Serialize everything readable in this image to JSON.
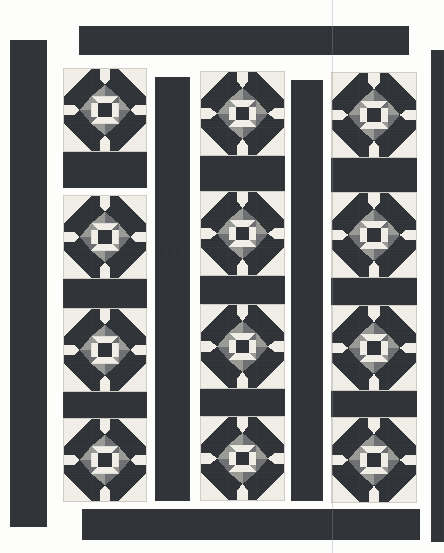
{
  "artwork": {
    "title": "Patchwork Quilt Top Layout",
    "pattern_name": "Dutch Rose / Carpenter's Star Blocks with Sashing",
    "background_color": "#fdfdfb",
    "canvas": {
      "width": 444,
      "height": 553
    }
  },
  "palette": {
    "background": "#fdfdfb",
    "sashing_dark": "#2f3236",
    "block_dark": "#2f3236",
    "block_light": "#f2f0e9",
    "block_mid_gray": "#9a9a96",
    "block_shadow_gray": "#6e7073",
    "block_border": "#cfcdc6"
  },
  "borders": [
    {
      "name": "left-border-strip",
      "x": 10,
      "y": 40,
      "w": 37,
      "h": 487
    },
    {
      "name": "right-border-strip",
      "x": 431,
      "y": 50,
      "w": 13,
      "h": 492
    },
    {
      "name": "top-border-strip",
      "x": 79,
      "y": 26,
      "w": 330,
      "h": 29
    },
    {
      "name": "bottom-border-strip",
      "x": 82,
      "y": 509,
      "w": 338,
      "h": 31
    }
  ],
  "vertical_sashing": [
    {
      "name": "vertical-sashing-1",
      "x": 155,
      "y": 77,
      "w": 35,
      "h": 424
    },
    {
      "name": "vertical-sashing-2",
      "x": 291,
      "y": 80,
      "w": 32,
      "h": 421
    }
  ],
  "columns": [
    {
      "name": "block-column-left",
      "x": 63,
      "w": 84,
      "blocks": [
        {
          "y": 68,
          "size": 84
        },
        {
          "y": 195,
          "size": 84
        },
        {
          "y": 308,
          "size": 84
        },
        {
          "y": 418,
          "size": 84
        }
      ],
      "horizontal_sashing": [
        {
          "y": 152,
          "h": 36
        },
        {
          "y": 279,
          "h": 29
        },
        {
          "y": 392,
          "h": 26
        }
      ]
    },
    {
      "name": "block-column-middle",
      "x": 200,
      "w": 85,
      "blocks": [
        {
          "y": 71,
          "size": 85
        },
        {
          "y": 191,
          "size": 85
        },
        {
          "y": 304,
          "size": 85
        },
        {
          "y": 416,
          "size": 85
        }
      ],
      "horizontal_sashing": [
        {
          "y": 156,
          "h": 35
        },
        {
          "y": 276,
          "h": 28
        },
        {
          "y": 389,
          "h": 27
        }
      ]
    },
    {
      "name": "block-column-right",
      "x": 331,
      "w": 86,
      "blocks": [
        {
          "y": 72,
          "size": 86
        },
        {
          "y": 192,
          "size": 86
        },
        {
          "y": 305,
          "size": 86
        },
        {
          "y": 417,
          "size": 86
        }
      ],
      "horizontal_sashing": [
        {
          "y": 158,
          "h": 34
        },
        {
          "y": 278,
          "h": 27
        },
        {
          "y": 391,
          "h": 26
        }
      ]
    }
  ],
  "block_design": {
    "name": "eight-point-star-block",
    "grid_units": 6,
    "description": "Eight pointed star with cream corner squares, dark star points, medium gray shadow diamonds and a dark center square with cream cross bars.",
    "counts": {
      "total_blocks": 12,
      "blocks_per_column": 4,
      "columns": 3
    }
  },
  "scan_artifacts": [
    {
      "name": "scan-seam-line",
      "x": 332
    }
  ]
}
